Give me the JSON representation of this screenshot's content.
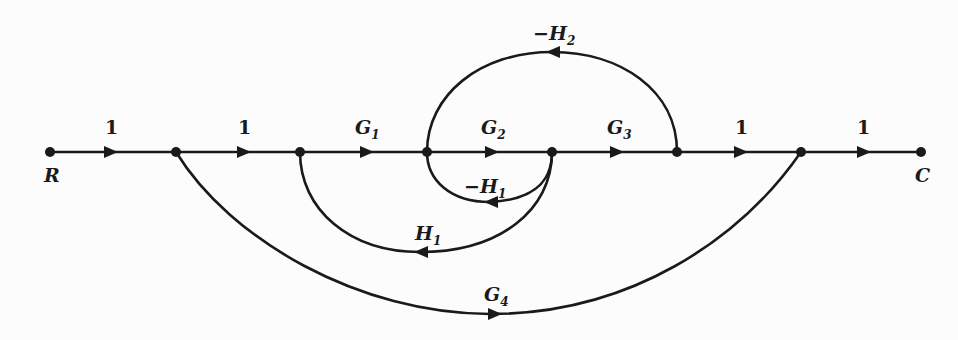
{
  "diagram": {
    "type": "signal-flow-graph",
    "nodes": [
      {
        "id": "R",
        "label": "R",
        "x": 50,
        "y": 152
      },
      {
        "id": "n2",
        "label": "",
        "x": 176,
        "y": 152
      },
      {
        "id": "n3",
        "label": "",
        "x": 300,
        "y": 152
      },
      {
        "id": "n4",
        "label": "",
        "x": 427,
        "y": 152
      },
      {
        "id": "n5",
        "label": "",
        "x": 552,
        "y": 152
      },
      {
        "id": "n6",
        "label": "",
        "x": 677,
        "y": 152
      },
      {
        "id": "n7",
        "label": "",
        "x": 801,
        "y": 152
      },
      {
        "id": "C",
        "label": "C",
        "x": 921,
        "y": 152
      }
    ],
    "edges": [
      {
        "from": "R",
        "to": "n2",
        "gain": "1",
        "base": "1",
        "sub": ""
      },
      {
        "from": "n2",
        "to": "n3",
        "gain": "1",
        "base": "1",
        "sub": ""
      },
      {
        "from": "n3",
        "to": "n4",
        "gain": "G1",
        "base": "G",
        "sub": "1"
      },
      {
        "from": "n4",
        "to": "n5",
        "gain": "G2",
        "base": "G",
        "sub": "2"
      },
      {
        "from": "n5",
        "to": "n6",
        "gain": "G3",
        "base": "G",
        "sub": "3"
      },
      {
        "from": "n6",
        "to": "n7",
        "gain": "1",
        "base": "1",
        "sub": ""
      },
      {
        "from": "n7",
        "to": "C",
        "gain": "1",
        "base": "1",
        "sub": ""
      },
      {
        "from": "n6",
        "to": "n4",
        "gain": "-H2",
        "base": "−H",
        "sub": "2"
      },
      {
        "from": "n5",
        "to": "n4",
        "gain": "-H1",
        "base": "−H",
        "sub": "1"
      },
      {
        "from": "n5",
        "to": "n3",
        "gain": "H1",
        "base": "H",
        "sub": "1"
      },
      {
        "from": "n2",
        "to": "n7",
        "gain": "G4",
        "base": "G",
        "sub": "4"
      }
    ]
  }
}
